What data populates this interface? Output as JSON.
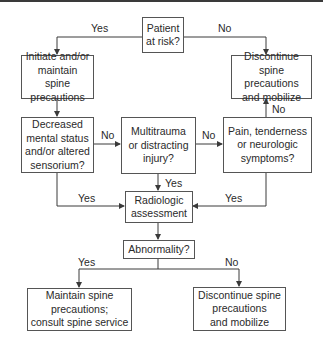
{
  "nodes": {
    "patient_at_risk": "Patient\nat risk?",
    "initiate_precautions": "Initiate and/or\nmaintain spine\nprecautions",
    "discontinue_top": "Discontinue\nspine precautions\nand mobilize",
    "decreased_mental_status": "Decreased\nmental status\nand/or altered\nsensorium?",
    "multitrauma": "Multitrauma\nor distracting\ninjury?",
    "pain_tenderness": "Pain, tenderness\nor neurologic\nsymptoms?",
    "radiologic_assessment": "Radiologic\nassessment",
    "abnormality": "Abnormality?",
    "maintain_consult": "Maintain spine\nprecautions;\nconsult spine service",
    "discontinue_bottom": "Discontinue spine\nprecautions\nand mobilize"
  },
  "edge_labels": {
    "patient_yes": "Yes",
    "patient_no": "No",
    "decreased_no": "No",
    "multitrauma_no": "No",
    "pain_no": "No",
    "multitrauma_yes": "Yes",
    "decreased_yes": "Yes",
    "pain_yes": "Yes",
    "abnormality_yes": "Yes",
    "abnormality_no": "No"
  },
  "colors": {
    "line": "#3a3a3a",
    "box_border": "#555555",
    "text": "#2a2a2a"
  }
}
